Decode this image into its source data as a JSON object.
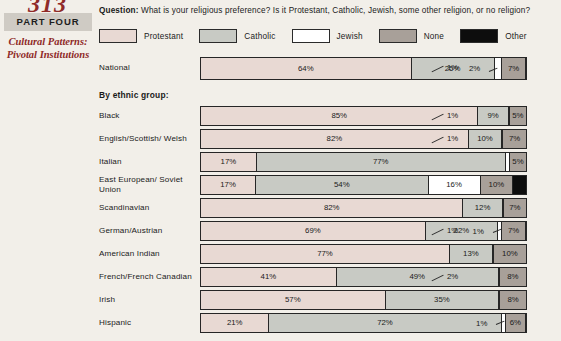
{
  "rail": {
    "folio": "313",
    "part_banner": "PART FOUR",
    "part_subtitle": "Cultural Patterns: Pivotal Institutions"
  },
  "question": {
    "prefix": "Question:",
    "text": "What is your religious preference?  Is it Protestant, Catholic, Jewish, some other religion, or no religion?"
  },
  "group_header": "By ethnic group:",
  "colors": {
    "protestant": "#e8d9d3",
    "catholic": "#c8cac4",
    "jewish": "#ffffff",
    "none": "#a8a099",
    "other": "#0d0d0d",
    "background": "#f2efe9",
    "rule": "#262626",
    "part_banner_bg": "#cfcbc4",
    "rail_accent": "#8f2a28"
  },
  "chart_data": {
    "type": "bar",
    "subtype": "stacked-horizontal-100",
    "xlabel": "",
    "ylabel": "",
    "xlim": [
      0,
      100
    ],
    "grid": false,
    "legend_position": "top",
    "series": [
      {
        "name": "Protestant",
        "color_key": "protestant"
      },
      {
        "name": "Catholic",
        "color_key": "catholic"
      },
      {
        "name": "Jewish",
        "color_key": "jewish"
      },
      {
        "name": "None",
        "color_key": "none"
      },
      {
        "name": "Other",
        "color_key": "other"
      }
    ],
    "national": {
      "label": "National",
      "segments": [
        {
          "series": "Protestant",
          "value": 64,
          "label": "64%",
          "inside": true
        },
        {
          "series": "Catholic",
          "value": 25,
          "label": "25%",
          "inside": true
        },
        {
          "series": "Jewish",
          "value": 2,
          "label": "2%",
          "inside": true,
          "leader": true
        },
        {
          "series": "None",
          "value": 7,
          "label": "7%",
          "inside": true
        },
        {
          "series": "Other",
          "value": 1,
          "label": "1%",
          "inside": false
        }
      ]
    },
    "categories": [
      "Black",
      "English/Scottish/ Welsh",
      "Italian",
      "East European/ Soviet Union",
      "Scandinavian",
      "German/Austrian",
      "American Indian",
      "French/French Canadian",
      "Irish",
      "Hispanic"
    ],
    "rows": [
      {
        "label": "Black",
        "segments": [
          {
            "series": "Protestant",
            "value": 85,
            "label": "85%",
            "inside": true
          },
          {
            "series": "Catholic",
            "value": 9,
            "label": "9%",
            "inside": true
          },
          {
            "series": "Jewish",
            "value": 0,
            "label": "",
            "inside": true
          },
          {
            "series": "None",
            "value": 5,
            "label": "5%",
            "inside": true
          },
          {
            "series": "Other",
            "value": 1,
            "label": "1%",
            "inside": false
          }
        ]
      },
      {
        "label": "English/Scottish/ Welsh",
        "segments": [
          {
            "series": "Protestant",
            "value": 82,
            "label": "82%",
            "inside": true
          },
          {
            "series": "Catholic",
            "value": 10,
            "label": "10%",
            "inside": true
          },
          {
            "series": "Jewish",
            "value": 0,
            "label": "",
            "inside": true
          },
          {
            "series": "None",
            "value": 7,
            "label": "7%",
            "inside": true
          },
          {
            "series": "Other",
            "value": 1,
            "label": "1%",
            "inside": false
          }
        ]
      },
      {
        "label": "Italian",
        "segments": [
          {
            "series": "Protestant",
            "value": 17,
            "label": "17%",
            "inside": true
          },
          {
            "series": "Catholic",
            "value": 77,
            "label": "77%",
            "inside": true
          },
          {
            "series": "Jewish",
            "value": 1,
            "label": "",
            "inside": true
          },
          {
            "series": "None",
            "value": 5,
            "label": "5%",
            "inside": true
          },
          {
            "series": "Other",
            "value": 0,
            "label": "",
            "inside": false
          }
        ]
      },
      {
        "label": "East European/ Soviet Union",
        "segments": [
          {
            "series": "Protestant",
            "value": 17,
            "label": "17%",
            "inside": true
          },
          {
            "series": "Catholic",
            "value": 54,
            "label": "54%",
            "inside": true
          },
          {
            "series": "Jewish",
            "value": 16,
            "label": "16%",
            "inside": true
          },
          {
            "series": "None",
            "value": 10,
            "label": "10%",
            "inside": true
          },
          {
            "series": "Other",
            "value": 4,
            "label": "4%",
            "inside": true
          }
        ]
      },
      {
        "label": "Scandinavian",
        "segments": [
          {
            "series": "Protestant",
            "value": 82,
            "label": "82%",
            "inside": true
          },
          {
            "series": "Catholic",
            "value": 12,
            "label": "12%",
            "inside": true
          },
          {
            "series": "Jewish",
            "value": 0,
            "label": "",
            "inside": true
          },
          {
            "series": "None",
            "value": 7,
            "label": "7%",
            "inside": true
          },
          {
            "series": "Other",
            "value": 0,
            "label": "",
            "inside": false
          }
        ]
      },
      {
        "label": "German/Austrian",
        "segments": [
          {
            "series": "Protestant",
            "value": 69,
            "label": "69%",
            "inside": true
          },
          {
            "series": "Catholic",
            "value": 22,
            "label": "22%",
            "inside": true
          },
          {
            "series": "Jewish",
            "value": 1,
            "label": "1%",
            "inside": true,
            "leader": true
          },
          {
            "series": "None",
            "value": 7,
            "label": "7%",
            "inside": true
          },
          {
            "series": "Other",
            "value": 1,
            "label": "1%",
            "inside": false
          }
        ]
      },
      {
        "label": "American Indian",
        "segments": [
          {
            "series": "Protestant",
            "value": 77,
            "label": "77%",
            "inside": true
          },
          {
            "series": "Catholic",
            "value": 13,
            "label": "13%",
            "inside": true
          },
          {
            "series": "Jewish",
            "value": 0,
            "label": "",
            "inside": true
          },
          {
            "series": "None",
            "value": 10,
            "label": "10%",
            "inside": true
          },
          {
            "series": "Other",
            "value": 0,
            "label": "",
            "inside": false
          }
        ]
      },
      {
        "label": "French/French Canadian",
        "segments": [
          {
            "series": "Protestant",
            "value": 41,
            "label": "41%",
            "inside": true
          },
          {
            "series": "Catholic",
            "value": 49,
            "label": "49%",
            "inside": true
          },
          {
            "series": "Jewish",
            "value": 0,
            "label": "",
            "inside": true
          },
          {
            "series": "None",
            "value": 8,
            "label": "8%",
            "inside": true
          },
          {
            "series": "Other",
            "value": 2,
            "label": "2%",
            "inside": false
          }
        ]
      },
      {
        "label": "Irish",
        "segments": [
          {
            "series": "Protestant",
            "value": 57,
            "label": "57%",
            "inside": true
          },
          {
            "series": "Catholic",
            "value": 35,
            "label": "35%",
            "inside": true
          },
          {
            "series": "Jewish",
            "value": 0,
            "label": "",
            "inside": true
          },
          {
            "series": "None",
            "value": 8,
            "label": "8%",
            "inside": true
          },
          {
            "series": "Other",
            "value": 0,
            "label": "",
            "inside": false
          }
        ]
      },
      {
        "label": "Hispanic",
        "segments": [
          {
            "series": "Protestant",
            "value": 21,
            "label": "21%",
            "inside": true
          },
          {
            "series": "Catholic",
            "value": 72,
            "label": "72%",
            "inside": true
          },
          {
            "series": "Jewish",
            "value": 1,
            "label": "1%",
            "inside": true,
            "leader": true
          },
          {
            "series": "None",
            "value": 6,
            "label": "6%",
            "inside": true
          },
          {
            "series": "Other",
            "value": 0,
            "label": "",
            "inside": false
          }
        ]
      }
    ]
  }
}
